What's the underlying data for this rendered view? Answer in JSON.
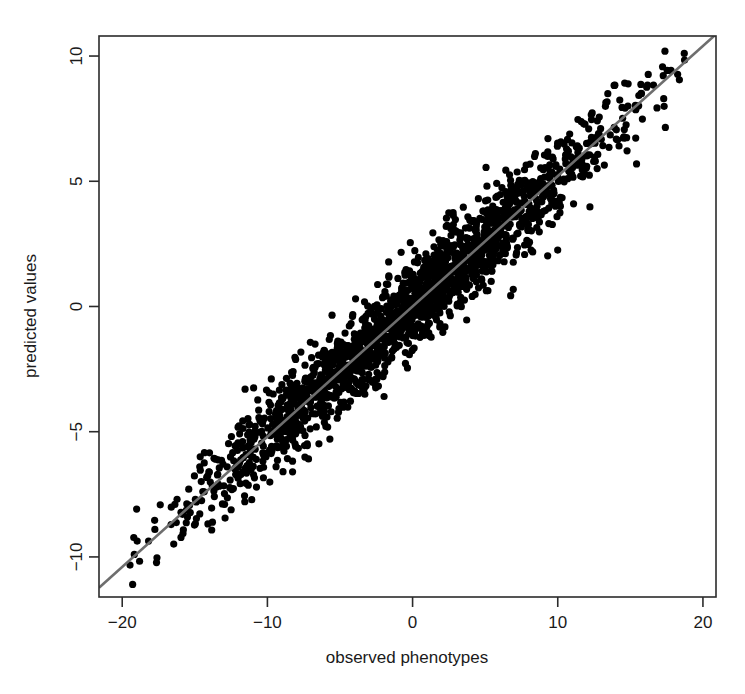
{
  "chart_data": {
    "type": "scatter",
    "title": "",
    "subtitle": "",
    "xlabel": "observed phenotypes",
    "ylabel": "predicted values",
    "xlim": [
      -21.6,
      20.9
    ],
    "ylim": [
      -11.6,
      10.8
    ],
    "xticks": [
      -20,
      -10,
      0,
      10,
      20
    ],
    "xticklabels": [
      "-20",
      "-10",
      "0",
      "10",
      "20"
    ],
    "yticks": [
      10,
      5,
      0,
      -5,
      -10
    ],
    "yticklabels": [
      "10",
      "5",
      "0",
      "-5",
      "-10"
    ],
    "grid": false,
    "legend": null,
    "annotations": [],
    "colors": {
      "point": "#000000",
      "line": "#6e6e6e",
      "axis": "#2b2b2b",
      "background": "#ffffff"
    },
    "point_marker": "filled-circle",
    "point_radius_px": 3.6,
    "n_points": 2000,
    "fit_line": {
      "label": "regression line",
      "slope": 0.52,
      "intercept": 0.0,
      "x_start": -21.6,
      "y_start": -11.23,
      "x_end": 20.9,
      "y_end": 10.87
    },
    "series": [
      {
        "name": "predicted vs observed",
        "marker": "filled-circle",
        "color": "#000000",
        "relationship": "y = 0.52 * x + noise",
        "noise_sd": 0.85,
        "x_range": [
          -19.5,
          19.4
        ],
        "y_range": [
          -10.6,
          9.8
        ],
        "x_sd": 7.2,
        "correlation": 0.97
      }
    ]
  },
  "axes": {
    "x": {
      "label": "observed phenotypes",
      "ticklabels": [
        "-20",
        "-10",
        "0",
        "10",
        "20"
      ]
    },
    "y": {
      "label": "predicted values",
      "ticklabels": [
        "10",
        "5",
        "0",
        "-5",
        "-10"
      ]
    }
  }
}
